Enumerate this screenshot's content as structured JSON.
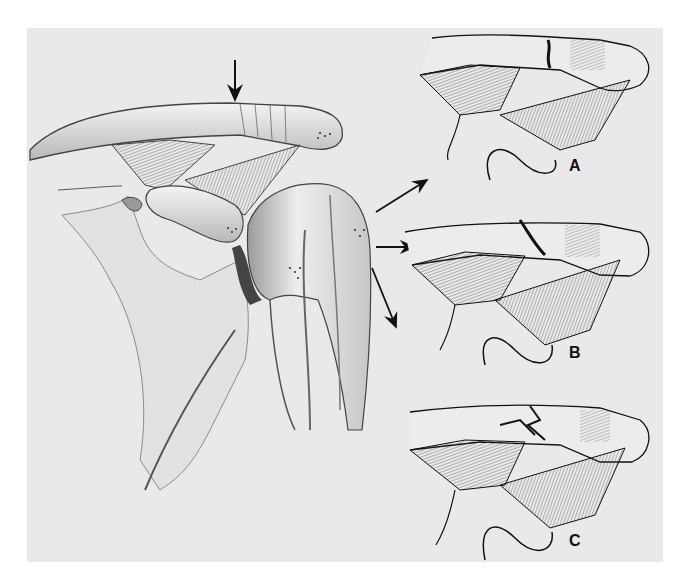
{
  "figure": {
    "background_color": "#e9e9e9",
    "page_color": "#ffffff",
    "ink_color": "#111111",
    "main_view": {
      "description": "Anterior view of right shoulder: clavicle, acromion, coracoid process, coracoclavicular ligaments, humeral head and scapula",
      "indicator_arrow": "down-arrow pointing at distal clavicle"
    },
    "callout_arrows": [
      "arrow to panel A",
      "arrow to panel B",
      "arrow to panel C"
    ],
    "panels": [
      {
        "label": "A",
        "description": "Distal clavicle fracture medial to coracoclavicular ligaments"
      },
      {
        "label": "B",
        "description": "Oblique distal clavicle fracture between ligaments"
      },
      {
        "label": "C",
        "description": "Comminuted distal clavicle fracture"
      }
    ]
  }
}
